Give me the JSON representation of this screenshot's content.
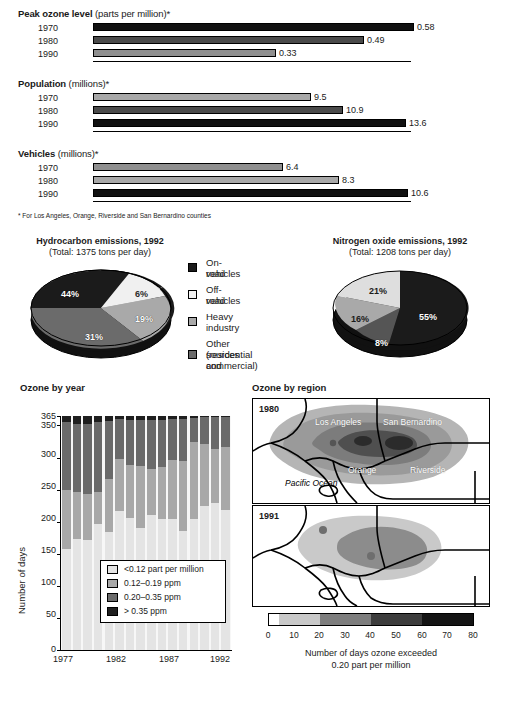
{
  "footnote": "* For Los Angeles, Orange, Riverside and San Bernardino counties",
  "panels": [
    {
      "title_bold": "Peak ozone level",
      "title_light": " (parts per million)*",
      "max": 0.6,
      "rows": [
        {
          "year": "1970",
          "value": "0.58",
          "v": 0.58,
          "shade": "d1"
        },
        {
          "year": "1980",
          "value": "0.49",
          "v": 0.49,
          "shade": "d2"
        },
        {
          "year": "1990",
          "value": "0.33",
          "v": 0.33,
          "shade": "d3"
        }
      ]
    },
    {
      "title_bold": "Population",
      "title_light": " (millions)*",
      "max": 14.1,
      "rows": [
        {
          "year": "1970",
          "value": "9.5",
          "v": 9.5,
          "shade": "d4"
        },
        {
          "year": "1980",
          "value": "10.9",
          "v": 10.9,
          "shade": "d2"
        },
        {
          "year": "1990",
          "value": "13.6",
          "v": 13.6,
          "shade": "d1"
        }
      ]
    },
    {
      "title_bold": "Vehicles",
      "title_light": " (millions)*",
      "max": 11.0,
      "rows": [
        {
          "year": "1970",
          "value": "6.4",
          "v": 6.4,
          "shade": "d3"
        },
        {
          "year": "1980",
          "value": "8.3",
          "v": 8.3,
          "shade": "d4"
        },
        {
          "year": "1990",
          "value": "10.6",
          "v": 10.6,
          "shade": "d1"
        }
      ]
    }
  ],
  "pies": {
    "legend": [
      {
        "label_line1": "On-road",
        "label_line2": "vehicles",
        "swatch": "sw-onroad"
      },
      {
        "label_line1": "Off-road",
        "label_line2": "vehicles",
        "swatch": "sw-offroad"
      },
      {
        "label_line1": "Heavy",
        "label_line2": "industry",
        "swatch": "sw-heavy"
      },
      {
        "label_line1": "Other sources",
        "label_line2": "(residential and",
        "label_line3": "commercial)",
        "swatch": "sw-other"
      }
    ],
    "left": {
      "title": "Hydrocarbon emissions, 1992",
      "subtitle": "(Total: 1375 tons per day)",
      "slices": [
        {
          "label": "44%",
          "value": 44,
          "category": "On-road vehicles"
        },
        {
          "label": "6%",
          "value": 6,
          "category": "Off-road vehicles"
        },
        {
          "label": "19%",
          "value": 19,
          "category": "Heavy industry"
        },
        {
          "label": "31%",
          "value": 31,
          "category": "Other sources"
        }
      ]
    },
    "right": {
      "title": "Nitrogen oxide emissions, 1992",
      "subtitle": "(Total: 1208 tons per day)",
      "slices": [
        {
          "label": "55%",
          "value": 55,
          "category": "On-road vehicles"
        },
        {
          "label": "8%",
          "value": 8,
          "category": "Off-road vehicles"
        },
        {
          "label": "16%",
          "value": 16,
          "category": "Heavy industry"
        },
        {
          "label": "21%",
          "value": 21,
          "category": "Other sources"
        }
      ]
    }
  },
  "ozone_by_year": {
    "title": "Ozone by year",
    "ylabel": "Number of days",
    "yticks": [
      "365",
      "350",
      "300",
      "250",
      "200",
      "150",
      "100",
      "50",
      "0"
    ],
    "xticks": [
      "1977",
      "1982",
      "1987",
      "1992"
    ],
    "legend": [
      "<0.12 part per million",
      "0.12–0.19 ppm",
      "0.20–0.35 ppm",
      "> 0.35 ppm"
    ]
  },
  "ozone_by_region": {
    "title": "Ozone by region",
    "maps": [
      {
        "year": "1980"
      },
      {
        "year": "1991"
      }
    ],
    "labels": {
      "los_angeles": "Los Angeles",
      "san_bernardino": "San Bernardino",
      "orange": "Orange",
      "riverside": "Riverside",
      "pacific_ocean": "Pacific Ocean"
    },
    "colorbar_ticks": [
      "0",
      "10",
      "20",
      "30",
      "40",
      "50",
      "60",
      "70",
      "80"
    ],
    "caption_line1": "Number of days ozone exceeded",
    "caption_line2": "0.20 part per million"
  },
  "chart_data": [
    {
      "type": "bar",
      "title": "Peak ozone level (parts per million)",
      "orientation": "horizontal",
      "categories": [
        "1970",
        "1980",
        "1990"
      ],
      "values": [
        0.58,
        0.49,
        0.33
      ],
      "xlabel": "parts per million",
      "ylabel": "",
      "note": "For Los Angeles, Orange, Riverside and San Bernardino counties"
    },
    {
      "type": "bar",
      "title": "Population (millions)",
      "orientation": "horizontal",
      "categories": [
        "1970",
        "1980",
        "1990"
      ],
      "values": [
        9.5,
        10.9,
        13.6
      ],
      "xlabel": "millions",
      "ylabel": ""
    },
    {
      "type": "bar",
      "title": "Vehicles (millions)",
      "orientation": "horizontal",
      "categories": [
        "1970",
        "1980",
        "1990"
      ],
      "values": [
        6.4,
        8.3,
        10.6
      ],
      "xlabel": "millions",
      "ylabel": ""
    },
    {
      "type": "pie",
      "title": "Hydrocarbon emissions, 1992",
      "subtitle": "(Total: 1375 tons per day)",
      "labels": [
        "On-road vehicles",
        "Off-road vehicles",
        "Heavy industry",
        "Other sources (residential and commercial)"
      ],
      "values": [
        44,
        6,
        19,
        31
      ],
      "unit": "percent"
    },
    {
      "type": "pie",
      "title": "Nitrogen oxide emissions, 1992",
      "subtitle": "(Total: 1208 tons per day)",
      "labels": [
        "On-road vehicles",
        "Off-road vehicles",
        "Heavy industry",
        "Other sources (residential and commercial)"
      ],
      "values": [
        55,
        8,
        16,
        21
      ],
      "unit": "percent"
    },
    {
      "type": "bar",
      "subtype": "stacked",
      "title": "Ozone by year",
      "xlabel": "",
      "ylabel": "Number of days",
      "ylim": [
        0,
        365
      ],
      "yticks": [
        0,
        50,
        100,
        150,
        200,
        250,
        300,
        350,
        365
      ],
      "categories": [
        1977,
        1978,
        1979,
        1980,
        1981,
        1982,
        1983,
        1984,
        1985,
        1986,
        1987,
        1988,
        1989,
        1990,
        1991,
        1992
      ],
      "series": [
        {
          "name": "<0.12 part per million",
          "values": [
            157,
            173,
            172,
            196,
            184,
            217,
            206,
            191,
            211,
            205,
            205,
            185,
            205,
            225,
            230,
            219
          ]
        },
        {
          "name": "0.12–0.19 ppm",
          "values": [
            93,
            73,
            72,
            50,
            83,
            81,
            82,
            96,
            71,
            81,
            92,
            110,
            119,
            96,
            83,
            97
          ]
        },
        {
          "name": "0.20–0.35 ppm",
          "values": [
            106,
            107,
            109,
            110,
            90,
            62,
            71,
            71,
            76,
            73,
            63,
            66,
            38,
            42,
            50,
            48
          ]
        },
        {
          "name": "> 0.35 ppm",
          "values": [
            9,
            12,
            12,
            9,
            8,
            5,
            6,
            7,
            7,
            6,
            5,
            4,
            3,
            2,
            2,
            1
          ]
        }
      ]
    },
    {
      "type": "heatmap",
      "title": "Ozone by region",
      "subtype": "choropleth-map",
      "panels": [
        "1980",
        "1991"
      ],
      "colorbar": {
        "ticks": [
          0,
          10,
          20,
          30,
          40,
          50,
          60,
          70,
          80
        ],
        "label": "Number of days ozone exceeded 0.20 part per million"
      },
      "regions": [
        "Los Angeles",
        "San Bernardino",
        "Orange",
        "Riverside",
        "Pacific Ocean"
      ]
    }
  ]
}
